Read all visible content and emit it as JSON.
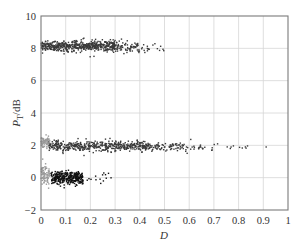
{
  "chart_data": {
    "type": "scatter",
    "title": "",
    "xlabel": "D",
    "ylabel_main": "P",
    "ylabel_sub": "T",
    "ylabel_unit": "/dB",
    "xlim": [
      0,
      1
    ],
    "ylim": [
      -2,
      10
    ],
    "x_ticks": [
      0,
      0.1,
      0.2,
      0.3,
      0.4,
      0.5,
      0.6,
      0.7,
      0.8,
      0.9,
      1
    ],
    "x_tick_labels": [
      "0",
      "0.1",
      "0.2",
      "0.3",
      "0.4",
      "0.5",
      "0.6",
      "0.7",
      "0.8",
      "0.9",
      "1"
    ],
    "y_ticks": [
      -2,
      0,
      2,
      4,
      6,
      8,
      10
    ],
    "y_tick_labels": [
      "−2",
      "0",
      "2",
      "4",
      "6",
      "8",
      "10"
    ],
    "grid": true,
    "legend": null,
    "series": [
      {
        "name": "cluster-8dB",
        "color": "#3a3a3a",
        "clusters": [
          {
            "count": 520,
            "x_min": 0.0,
            "x_max": 0.3,
            "y_mean": 8.15,
            "y_sd": 0.16,
            "x_dist": "uniform"
          },
          {
            "count": 90,
            "x_min": 0.28,
            "x_max": 0.4,
            "y_mean": 8.1,
            "y_sd": 0.17,
            "x_dist": "uniform"
          },
          {
            "count": 18,
            "x_min": 0.4,
            "x_max": 0.5,
            "y_mean": 8.05,
            "y_sd": 0.2,
            "x_dist": "uniform"
          }
        ]
      },
      {
        "name": "cluster-2dB",
        "color": "#3a3a3a",
        "clusters": [
          {
            "count": 480,
            "x_min": 0.03,
            "x_max": 0.45,
            "y_mean": 1.95,
            "y_sd": 0.15,
            "x_dist": "uniform"
          },
          {
            "count": 70,
            "x_min": 0.45,
            "x_max": 0.6,
            "y_mean": 1.9,
            "y_sd": 0.15,
            "x_dist": "uniform"
          },
          {
            "count": 22,
            "x_min": 0.6,
            "x_max": 0.73,
            "y_mean": 1.85,
            "y_sd": 0.15,
            "x_dist": "uniform"
          },
          {
            "count": 9,
            "x_min": 0.74,
            "x_max": 0.84,
            "y_mean": 1.9,
            "y_sd": 0.06,
            "x_dist": "uniform"
          },
          {
            "count": 1,
            "x_min": 0.91,
            "x_max": 0.915,
            "y_mean": 1.9,
            "y_sd": 0.02,
            "x_dist": "uniform"
          }
        ]
      },
      {
        "name": "cluster-0dB",
        "color": "#111111",
        "clusters": [
          {
            "count": 330,
            "x_min": 0.04,
            "x_max": 0.17,
            "y_mean": 0.0,
            "y_sd": 0.2,
            "x_dist": "uniform"
          },
          {
            "count": 14,
            "x_min": 0.17,
            "x_max": 0.32,
            "y_mean": -0.05,
            "y_sd": 0.15,
            "x_dist": "uniform"
          }
        ]
      },
      {
        "name": "cluster-near-zero",
        "color": "#9a9a9a",
        "clusters": [
          {
            "count": 70,
            "x_min": 0.0,
            "x_max": 0.035,
            "y_mean": 2.25,
            "y_sd": 0.16,
            "x_dist": "uniform"
          },
          {
            "count": 80,
            "x_min": 0.0,
            "x_max": 0.035,
            "y_mean": 0.25,
            "y_sd": 0.28,
            "x_dist": "uniform"
          }
        ]
      }
    ]
  }
}
